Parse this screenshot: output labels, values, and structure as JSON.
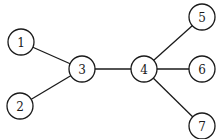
{
  "diagram": {
    "type": "tree-graph",
    "nodes": [
      {
        "id": "1",
        "label": "1",
        "x": 21,
        "y": 42
      },
      {
        "id": "2",
        "label": "2",
        "x": 20,
        "y": 106
      },
      {
        "id": "3",
        "label": "3",
        "x": 82,
        "y": 69
      },
      {
        "id": "4",
        "label": "4",
        "x": 144,
        "y": 69
      },
      {
        "id": "5",
        "label": "5",
        "x": 202,
        "y": 17
      },
      {
        "id": "6",
        "label": "6",
        "x": 202,
        "y": 69
      },
      {
        "id": "7",
        "label": "7",
        "x": 202,
        "y": 126
      }
    ],
    "edges": [
      {
        "from": "1",
        "to": "3"
      },
      {
        "from": "2",
        "to": "3"
      },
      {
        "from": "3",
        "to": "4"
      },
      {
        "from": "4",
        "to": "5"
      },
      {
        "from": "4",
        "to": "6"
      },
      {
        "from": "4",
        "to": "7"
      }
    ],
    "node_radius": 13
  }
}
